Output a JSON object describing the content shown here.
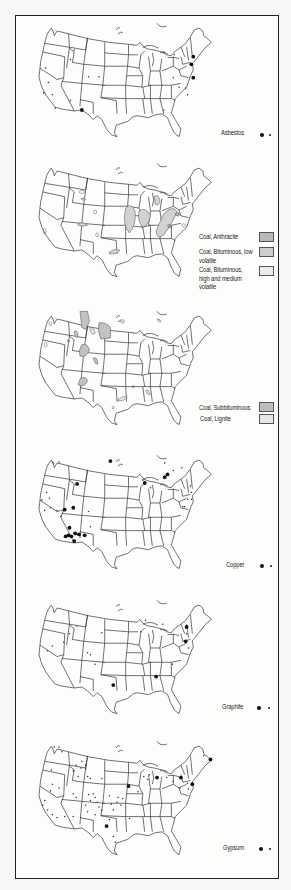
{
  "page": {
    "type": "atlas page: mineral deposit maps of the conterminous United States",
    "background": "#fdfdfb",
    "frame_color": "#222222"
  },
  "panels": [
    {
      "id": "asbestos",
      "legend": [
        {
          "label": "Asbestos",
          "symbol": "dot-large-and-small"
        }
      ],
      "major_sites": [
        [
          66,
          96
        ],
        [
          183,
          40
        ],
        [
          181,
          48
        ],
        [
          183,
          62
        ]
      ],
      "minor_sites": [
        [
          58,
          33
        ],
        [
          54,
          43
        ],
        [
          28,
          52
        ],
        [
          84,
          61
        ],
        [
          73,
          61
        ],
        [
          31,
          67
        ],
        [
          26,
          78
        ],
        [
          35,
          80
        ],
        [
          38,
          94
        ],
        [
          54,
          86
        ],
        [
          152,
          35
        ],
        [
          163,
          38
        ],
        [
          162,
          62
        ],
        [
          152,
          96
        ],
        [
          175,
          73
        ],
        [
          177,
          80
        ],
        [
          168,
          72
        ]
      ]
    },
    {
      "id": "coal-bituminous",
      "legend": [
        {
          "label": "Coal, Anthracite",
          "swatch": "#b9b9b9"
        },
        {
          "label": "Coal, Bituminous, low volatile",
          "swatch": "#cdcdcd"
        },
        {
          "label": "Coal, Bituminous, high and medium volatile",
          "swatch": "#ececec"
        }
      ]
    },
    {
      "id": "coal-subbituminous-lignite",
      "legend": [
        {
          "label": "Coal, Subbituminous",
          "swatch": "#bdbdbd"
        },
        {
          "label": "Coal, Lignite",
          "swatch": "#e6e6e6"
        }
      ]
    },
    {
      "id": "copper",
      "legend": [
        {
          "label": "Copper",
          "symbol": "dot-large-and-small"
        }
      ],
      "major_sites": [
        [
          96,
          11
        ],
        [
          61,
          35
        ],
        [
          132,
          34
        ],
        [
          153,
          28
        ],
        [
          156,
          25
        ],
        [
          48,
          62
        ],
        [
          57,
          60
        ],
        [
          53,
          81
        ],
        [
          52,
          89
        ],
        [
          55,
          90
        ],
        [
          59,
          87
        ],
        [
          63,
          88
        ],
        [
          69,
          89
        ],
        [
          49,
          90
        ],
        [
          58,
          95
        ]
      ],
      "minor_sites": [
        [
          36,
          13
        ],
        [
          42,
          12
        ],
        [
          29,
          44
        ],
        [
          32,
          50
        ],
        [
          24,
          52
        ],
        [
          33,
          60
        ],
        [
          27,
          63
        ],
        [
          40,
          63
        ],
        [
          44,
          69
        ],
        [
          73,
          64
        ],
        [
          75,
          80
        ],
        [
          153,
          13
        ],
        [
          171,
          18
        ],
        [
          162,
          21
        ],
        [
          180,
          37
        ],
        [
          181,
          44
        ],
        [
          177,
          51
        ],
        [
          174,
          59
        ],
        [
          181,
          51
        ],
        [
          130,
          31
        ],
        [
          138,
          39
        ],
        [
          172,
          59
        ]
      ]
    },
    {
      "id": "graphite",
      "legend": [
        {
          "label": "Graphite",
          "symbol": "dot-large-and-small"
        }
      ],
      "major_sites": [
        [
          176,
          33
        ],
        [
          175,
          48
        ],
        [
          99,
          94
        ],
        [
          144,
          85
        ]
      ],
      "minor_sites": [
        [
          61,
          32
        ],
        [
          53,
          40
        ],
        [
          87,
          39
        ],
        [
          35,
          53
        ],
        [
          30,
          58
        ],
        [
          47,
          49
        ],
        [
          72,
          60
        ],
        [
          75,
          62
        ],
        [
          80,
          72
        ],
        [
          128,
          38
        ],
        [
          133,
          26
        ],
        [
          151,
          30
        ],
        [
          161,
          72
        ],
        [
          178,
          55
        ],
        [
          176,
          40
        ]
      ]
    },
    {
      "id": "gypsum",
      "legend": [
        {
          "label": "Gypsum",
          "symbol": "dot-large-and-small"
        }
      ],
      "major_sites": [
        [
          115,
          52
        ],
        [
          145,
          43
        ],
        [
          170,
          43
        ],
        [
          92,
          94
        ],
        [
          201,
          24
        ],
        [
          182,
          50
        ]
      ],
      "minor_sites": [
        [
          37,
          11
        ],
        [
          42,
          11
        ],
        [
          45,
          16
        ],
        [
          34,
          35
        ],
        [
          66,
          26
        ],
        [
          70,
          30
        ],
        [
          60,
          30
        ],
        [
          65,
          33
        ],
        [
          70,
          34
        ],
        [
          57,
          36
        ],
        [
          72,
          42
        ],
        [
          75,
          44
        ],
        [
          62,
          42
        ],
        [
          87,
          44
        ],
        [
          35,
          50
        ],
        [
          33,
          57
        ],
        [
          42,
          54
        ],
        [
          57,
          60
        ],
        [
          60,
          64
        ],
        [
          73,
          61
        ],
        [
          78,
          60
        ],
        [
          80,
          64
        ],
        [
          75,
          67
        ],
        [
          82,
          69
        ],
        [
          70,
          72
        ],
        [
          72,
          79
        ],
        [
          80,
          82
        ],
        [
          95,
          87
        ],
        [
          84,
          74
        ],
        [
          87,
          77
        ],
        [
          99,
          77
        ],
        [
          97,
          71
        ],
        [
          103,
          69
        ],
        [
          104,
          64
        ],
        [
          109,
          65
        ],
        [
          107,
          72
        ],
        [
          95,
          62
        ],
        [
          27,
          67
        ],
        [
          25,
          72
        ],
        [
          30,
          77
        ],
        [
          35,
          82
        ],
        [
          40,
          85
        ],
        [
          48,
          84
        ],
        [
          57,
          84
        ],
        [
          99,
          105
        ],
        [
          101,
          111
        ],
        [
          125,
          58
        ],
        [
          131,
          42
        ],
        [
          135,
          45
        ],
        [
          155,
          43
        ],
        [
          162,
          47
        ],
        [
          169,
          54
        ],
        [
          177,
          49
        ],
        [
          178,
          55
        ],
        [
          194,
          20
        ],
        [
          116,
          86
        ],
        [
          137,
          40
        ]
      ]
    }
  ],
  "chart_data": [
    {
      "type": "map",
      "title": "Asbestos",
      "legend": [
        "Asbestos (large dot = major, small dot = minor)"
      ]
    },
    {
      "type": "map",
      "title": "Coal, Bituminous & Anthracite",
      "legend": [
        "Coal, Anthracite",
        "Coal, Bituminous, low volatile",
        "Coal, Bituminous, high and medium volatile"
      ]
    },
    {
      "type": "map",
      "title": "Coal, Subbituminous & Lignite",
      "legend": [
        "Coal, Subbituminous",
        "Coal, Lignite"
      ]
    },
    {
      "type": "map",
      "title": "Copper",
      "legend": [
        "Copper (large dot = major, small dot = minor)"
      ]
    },
    {
      "type": "map",
      "title": "Graphite",
      "legend": [
        "Graphite (large dot = major, small dot = minor)"
      ]
    },
    {
      "type": "map",
      "title": "Gypsum",
      "legend": [
        "Gypsum (large dot = major, small dot = minor)"
      ]
    }
  ]
}
